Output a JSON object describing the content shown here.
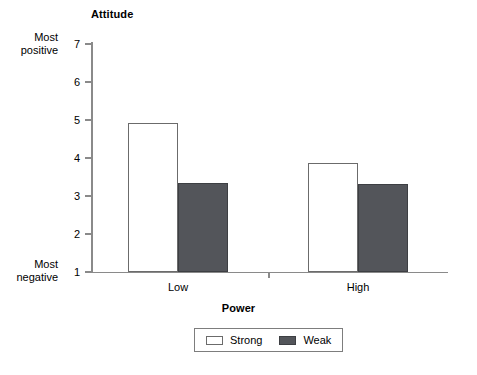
{
  "chart_data": {
    "type": "bar",
    "title": "",
    "xlabel": "Power",
    "ylabel": "Attitude",
    "categories": [
      "Low",
      "High"
    ],
    "series": [
      {
        "name": "Strong",
        "values": [
          4.93,
          3.87
        ],
        "color": "#ffffff"
      },
      {
        "name": "Weak",
        "values": [
          3.34,
          3.32
        ],
        "color": "#53555a"
      }
    ],
    "ylim": [
      1,
      7
    ],
    "yticks": [
      1,
      2,
      3,
      4,
      5,
      6,
      7
    ],
    "ytick_labels": [
      "1",
      "2",
      "3",
      "4",
      "5",
      "6",
      "7"
    ],
    "y_axis_endpoint_labels": {
      "high": "Most\npositive",
      "low": "Most\nnegative"
    },
    "grid": false,
    "legend_position": "bottom-center"
  },
  "axes": {
    "y_title": "Attitude",
    "x_title": "Power"
  },
  "y_ticks": [
    {
      "label": "7",
      "value": 7
    },
    {
      "label": "6",
      "value": 6
    },
    {
      "label": "5",
      "value": 5
    },
    {
      "label": "4",
      "value": 4
    },
    {
      "label": "3",
      "value": 3
    },
    {
      "label": "2",
      "value": 2
    },
    {
      "label": "1",
      "value": 1
    }
  ],
  "endpoints": {
    "top_line1": "Most",
    "top_line2": "positive",
    "bottom_line1": "Most",
    "bottom_line2": "negative"
  },
  "categories": [
    {
      "label": "Low"
    },
    {
      "label": "High"
    }
  ],
  "bars": [
    {
      "group": "Low",
      "series": "Strong",
      "value": 4.93
    },
    {
      "group": "Low",
      "series": "Weak",
      "value": 3.34
    },
    {
      "group": "High",
      "series": "Strong",
      "value": 3.87
    },
    {
      "group": "High",
      "series": "Weak",
      "value": 3.32
    }
  ],
  "legend": {
    "entries": [
      {
        "label": "Strong",
        "swatch": "strong"
      },
      {
        "label": "Weak",
        "swatch": "weak"
      }
    ]
  }
}
